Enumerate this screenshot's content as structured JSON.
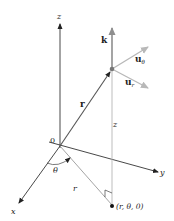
{
  "figure": {
    "labels": {
      "z_axis": "z",
      "x_axis": "x",
      "y_axis": "y",
      "origin": "0",
      "k_vector": "k",
      "u_theta_main": "u",
      "u_theta_sub": "θ",
      "u_r_main": "u",
      "u_r_sub": "r",
      "r_vector": "r",
      "z_height": "z",
      "theta_angle": "θ",
      "r_projection": "r",
      "foot_point": "(r, θ, 0)"
    },
    "colors": {
      "axis": "#222222",
      "gray_vector": "#8e8e8e",
      "light_line": "#b5b5b5",
      "point": "#222222"
    }
  }
}
